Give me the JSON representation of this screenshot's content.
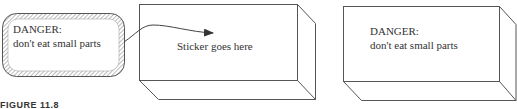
{
  "figure": {
    "caption": "FIGURE 11.8",
    "colors": {
      "line": "#555555",
      "text": "#333333",
      "hatch": "#777777"
    }
  },
  "sticker": {
    "line1": "DANGER:",
    "line2": "don't eat small parts"
  },
  "box_before": {
    "label": "Sticker goes here"
  },
  "box_after": {
    "line1": "DANGER:",
    "line2": "don't eat small parts"
  }
}
